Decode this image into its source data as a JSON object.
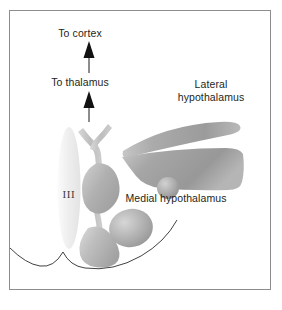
{
  "figure": {
    "width": 282,
    "height": 310,
    "background": "#ffffff",
    "border_color": "#8d8d8d"
  },
  "labels": {
    "to_cortex": "To cortex",
    "to_thalamus": "To thalamus",
    "lateral_hypothalamus": "Lateral hypothalamus",
    "lateral_hypothalamus_line1": "Lateral",
    "lateral_hypothalamus_line2": "hypothalamus",
    "medial_hypothalamus": "Medial hypothalamus",
    "third_ventricle": "III"
  },
  "arrows": [
    {
      "name": "arrow-to-cortex",
      "direction": "up",
      "color": "#1a1a1a"
    },
    {
      "name": "arrow-to-thalamus",
      "direction": "up",
      "color": "#1a1a1a"
    }
  ],
  "structures": [
    {
      "name": "third-ventricle",
      "shape": "ellipse",
      "fill": "#f0f0f0"
    },
    {
      "name": "fornix",
      "shape": "y-branch",
      "fill": "#c9c9c9"
    },
    {
      "name": "medial-nucleus",
      "shape": "teardrop",
      "fill": "#b8b8b8"
    },
    {
      "name": "mammillary-body",
      "shape": "oval",
      "fill": "#b0b0b0"
    },
    {
      "name": "infundibulum",
      "shape": "wedge",
      "fill": "#bdbdbd"
    },
    {
      "name": "lateral-band-upper",
      "shape": "tapered-band",
      "fill": "#a8a8a8"
    },
    {
      "name": "lateral-band-lower",
      "shape": "wedge-band",
      "fill": "#a0a0a0"
    },
    {
      "name": "small-nucleus",
      "shape": "circle",
      "fill": "#9f9f9f"
    },
    {
      "name": "ventral-brain-outline",
      "shape": "curve",
      "stroke": "#2b2b2b"
    }
  ],
  "colors": {
    "ink": "#231f20",
    "border": "#8d8d8d",
    "gray_light": "#e6e6e6",
    "gray_mid": "#b4b4b4",
    "gray_dark": "#8a8a8a"
  }
}
